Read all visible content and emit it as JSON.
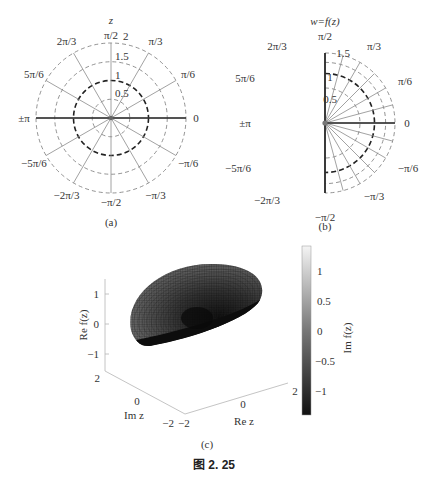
{
  "figure_caption": "图 2. 25",
  "chart_data": [
    {
      "type": "polar_grid",
      "panel": "(a)",
      "title": "z",
      "caption": "(a)",
      "radii": [
        0.5,
        1,
        1.5,
        2
      ],
      "radius_labels": [
        "0.5",
        "1",
        "1.5",
        "2"
      ],
      "bold_radius": 1,
      "max_radius": 2,
      "angles_deg": [
        0,
        30,
        60,
        90,
        120,
        150,
        180,
        -150,
        -120,
        -90,
        -60,
        -30
      ],
      "angle_labels": [
        "0",
        "π/6",
        "π/3",
        "π/2",
        "2π/3",
        "5π/6",
        "±π",
        "−5π/6",
        "−2π/3",
        "−π/2",
        "−π/3",
        "−π/6"
      ],
      "bold_axis": "real"
    },
    {
      "type": "polar_grid_mapped",
      "panel": "(b)",
      "title": "w=f(z)",
      "caption": "(b)",
      "mapping": "w = sqrt(z)",
      "radii": [
        0.7071,
        1,
        1.2247,
        1.4142
      ],
      "radius_labels": [
        "0.5",
        "1",
        "1.5"
      ],
      "bold_radius": 1,
      "max_radius": 1.4142,
      "ray_angles_deg": [
        0,
        15,
        30,
        45,
        60,
        75,
        90,
        -15,
        -30,
        -45,
        -60,
        -75,
        -90
      ],
      "angle_labels": [
        "0",
        "π/6",
        "π/3",
        "π/2",
        "2π/3",
        "5π/6",
        "±π",
        "−5π/6",
        "−2π/3",
        "−π/2",
        "−π/3",
        "−π/6"
      ],
      "bold_axis": "imaginary-and-real"
    },
    {
      "type": "surface3d",
      "panel": "(c)",
      "caption": "(c)",
      "function": "Re f(z), f(z)=sqrt(z)",
      "xlabel": "Re z",
      "ylabel": "Im z",
      "zlabel": "Re f(z)",
      "x_ticks": [
        "−2",
        "0",
        "2"
      ],
      "y_ticks": [
        "−2",
        "0",
        "2"
      ],
      "z_ticks": [
        "−1",
        "0",
        "1"
      ],
      "xlim": [
        -2,
        2
      ],
      "ylim": [
        -2,
        2
      ],
      "zlim": [
        -1.4,
        1.4
      ],
      "colorbar": {
        "label": "Im f(z)",
        "ticks": [
          "1",
          "0.5",
          "0",
          "−0.5",
          "−1"
        ],
        "range": [
          -1.4,
          1.4
        ],
        "colormap": "gray"
      }
    }
  ],
  "colors": {
    "grid": "#8a8a8a",
    "axis": "#2a2a2a",
    "bold_circle": "#222222",
    "dashed": "#777777"
  }
}
